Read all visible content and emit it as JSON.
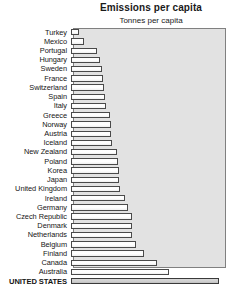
{
  "chart_data": {
    "type": "bar",
    "orientation": "horizontal",
    "title": "Emissions per capita",
    "subtitle": "Tonnes per capita",
    "xlabel": "",
    "ylabel": "",
    "grid": false,
    "legend": null,
    "xlim": [
      0,
      20.0
    ],
    "categories": [
      "Turkey",
      "Mexico",
      "Portugal",
      "Hungary",
      "Sweden",
      "France",
      "Switzerland",
      "Spain",
      "Italy",
      "Greece",
      "Norway",
      "Austria",
      "Iceland",
      "New Zealand",
      "Poland",
      "Korea",
      "Japan",
      "United Kingdom",
      "Ireland",
      "Germany",
      "Czech Republic",
      "Denmark",
      "Netherlands",
      "Belgium",
      "Finland",
      "Canada",
      "Australia",
      "UNITED STATES"
    ],
    "values": [
      1.1,
      1.7,
      3.4,
      3.8,
      4.1,
      4.3,
      4.4,
      4.5,
      4.6,
      5.2,
      5.3,
      5.3,
      5.4,
      6.1,
      6.2,
      6.3,
      6.4,
      6.5,
      7.2,
      7.6,
      8.1,
      8.1,
      8.1,
      8.6,
      9.7,
      11.4,
      13.0,
      19.6
    ],
    "highlight_category": "UNITED STATES",
    "colors": {
      "plot_background": "#e2e2e2",
      "plot_border": "#808080",
      "bar_fill": "#ffffff",
      "bar_outline": "#4a4a4a",
      "highlight_fill": "#cfcfcf",
      "text": "#151515",
      "page_background": "#ffffff"
    }
  }
}
